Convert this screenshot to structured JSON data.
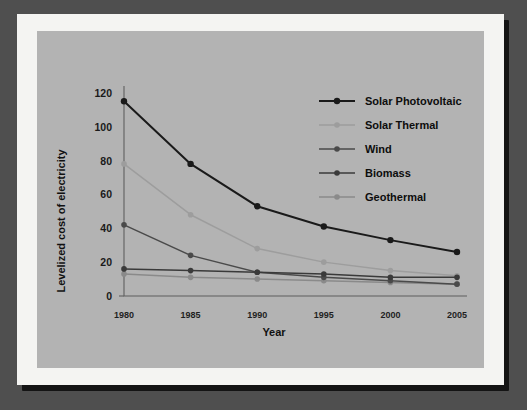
{
  "figure": {
    "frame_color": "#f4f4f2",
    "panel_color": "#b3b3b3",
    "backdrop_color": "#4f4f4f",
    "shadow_color": "#141414"
  },
  "chart_data": {
    "type": "line",
    "title": "",
    "xlabel": "Year",
    "ylabel": "Levelized cost of electricity",
    "categories": [
      "1980",
      "1985",
      "1990",
      "1995",
      "2000",
      "2005"
    ],
    "x": [
      1980,
      1985,
      1990,
      1995,
      2000,
      2005
    ],
    "xlim": [
      1980,
      2005
    ],
    "ylim": [
      0,
      124
    ],
    "y_ticks": [
      "0",
      "20",
      "40",
      "60",
      "80",
      "100",
      "120"
    ],
    "y_tick_values": [
      0,
      20,
      40,
      60,
      80,
      100,
      120
    ],
    "x_ticks": [
      "1980",
      "1985",
      "1990",
      "1995",
      "2000",
      "2005"
    ],
    "grid": false,
    "legend_position": "upper right",
    "series": [
      {
        "name": "Solar Photovoltaic",
        "color": "#1a1a1a",
        "marker": "circle",
        "values": [
          115,
          78,
          53,
          41,
          33,
          26
        ]
      },
      {
        "name": "Solar Thermal",
        "color": "#9d9d9d",
        "marker": "circle",
        "values": [
          78,
          48,
          28,
          20,
          15,
          12
        ]
      },
      {
        "name": "Wind",
        "color": "#4a4a4a",
        "marker": "circle",
        "values": [
          42,
          24,
          14,
          11,
          9,
          7
        ]
      },
      {
        "name": "Biomass",
        "color": "#3a3a3a",
        "marker": "circle",
        "values": [
          16,
          15,
          14,
          13,
          11,
          11
        ]
      },
      {
        "name": "Geothermal",
        "color": "#8a8a8a",
        "marker": "circle",
        "values": [
          13,
          11,
          10,
          9,
          8,
          7
        ]
      }
    ]
  }
}
